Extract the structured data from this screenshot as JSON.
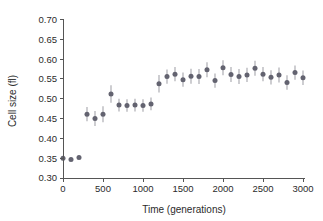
{
  "chart_data": {
    "type": "scatter",
    "title": "",
    "xlabel": "Time (generations)",
    "ylabel": "Cell size (fl)",
    "xlim": [
      0,
      3000
    ],
    "ylim": [
      0.3,
      0.7
    ],
    "xticks": [
      0,
      500,
      1000,
      1500,
      2000,
      2500,
      3000
    ],
    "xtick_labels": [
      "0",
      "500",
      "1000",
      "1500",
      "2000",
      "2500",
      "3000"
    ],
    "yticks": [
      0.3,
      0.35,
      0.4,
      0.45,
      0.5,
      0.55,
      0.6,
      0.65,
      0.7
    ],
    "ytick_labels": [
      "0.30",
      "0.35",
      "0.40",
      "0.45",
      "0.50",
      "0.55",
      "0.60",
      "0.65",
      "0.70"
    ],
    "grid": false,
    "legend": null,
    "marker_color": "#636370",
    "errorbar_color": "#b3b3b8",
    "series": [
      {
        "name": "Cell size",
        "x": [
          0,
          100,
          200,
          300,
          400,
          500,
          600,
          700,
          800,
          900,
          1000,
          1100,
          1200,
          1300,
          1400,
          1500,
          1600,
          1700,
          1800,
          1900,
          2000,
          2100,
          2200,
          2300,
          2400,
          2500,
          2600,
          2700,
          2800,
          2900,
          3000
        ],
        "y": [
          0.35,
          0.347,
          0.352,
          0.461,
          0.45,
          0.461,
          0.512,
          0.484,
          0.483,
          0.484,
          0.483,
          0.487,
          0.538,
          0.556,
          0.562,
          0.548,
          0.557,
          0.556,
          0.573,
          0.546,
          0.578,
          0.561,
          0.556,
          0.56,
          0.577,
          0.562,
          0.554,
          0.56,
          0.541,
          0.566,
          0.553
        ],
        "yerr": [
          0.004,
          0.004,
          0.005,
          0.018,
          0.019,
          0.02,
          0.022,
          0.016,
          0.016,
          0.016,
          0.016,
          0.016,
          0.022,
          0.018,
          0.018,
          0.018,
          0.019,
          0.019,
          0.019,
          0.018,
          0.019,
          0.019,
          0.019,
          0.018,
          0.019,
          0.018,
          0.018,
          0.019,
          0.018,
          0.018,
          0.018
        ]
      }
    ]
  }
}
